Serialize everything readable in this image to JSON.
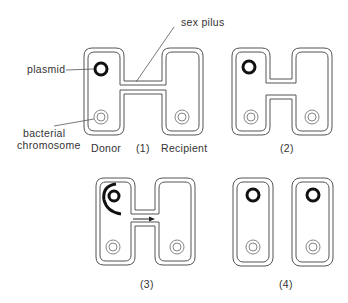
{
  "figure": {
    "labels": {
      "plasmid": "plasmid",
      "sex_pilus": "sex pilus",
      "bacterial_chromosome_line1": "bacterial",
      "bacterial_chromosome_line2": "chromosome",
      "donor": "Donor",
      "recipient": "Recipient"
    },
    "panels": [
      {
        "id": "1",
        "caption": "(1)",
        "description": "Donor with plasmid connects to recipient through sex pilus"
      },
      {
        "id": "2",
        "caption": "(2)",
        "description": "Cells drawn together, cytoplasmic bridge formed"
      },
      {
        "id": "3",
        "caption": "(3)",
        "description": "Plasmid replicates; single strand transferred to recipient (arrow)"
      },
      {
        "id": "4",
        "caption": "(4)",
        "description": "Cells separate, both contain plasmid"
      }
    ],
    "colors": {
      "background": "#ffffff",
      "outline": "#555555",
      "plasmid": "#111111",
      "text": "#333333"
    }
  }
}
